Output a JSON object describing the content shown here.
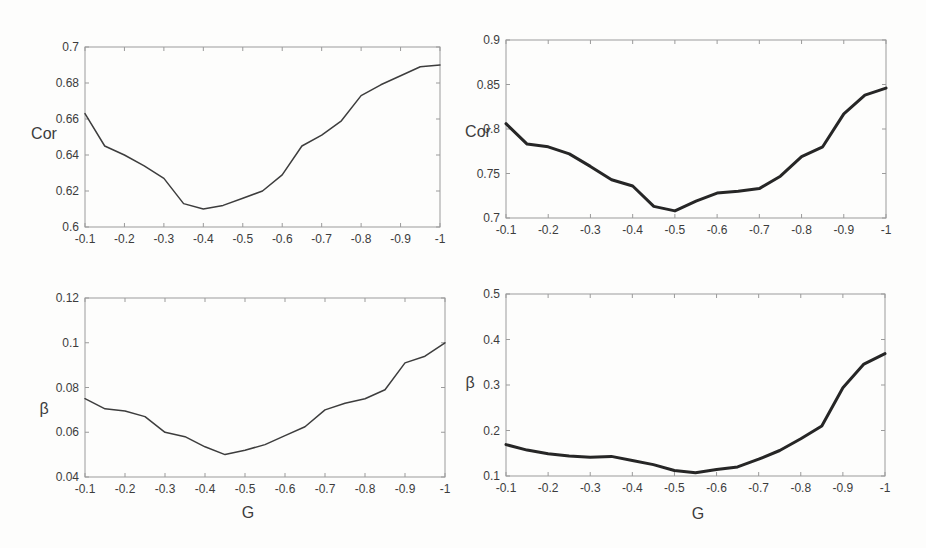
{
  "figure": {
    "background": "#fdfdfc",
    "text_color": "#3c3c3c",
    "axis_color": "#9b9b9b",
    "left_column_line_color": "#3d3d3d",
    "right_column_line_color": "#262626"
  },
  "chart_data": [
    {
      "id": "cor-vs-g-left",
      "type": "line",
      "position": "top-left",
      "title": "",
      "ylabel": "Cor",
      "xlabel": "",
      "legend": "none",
      "grid": false,
      "xlim": [
        -0.1,
        -1
      ],
      "ylim": [
        0.6,
        0.7
      ],
      "xticks": [
        -0.1,
        -0.2,
        -0.3,
        -0.4,
        -0.5,
        -0.6,
        -0.7,
        -0.8,
        -0.9,
        -1
      ],
      "xtick_labels": [
        "-0.1",
        "-0.2",
        "-0.3",
        "-0.4",
        "-0.5",
        "-0.6",
        "-0.7",
        "-0.8",
        "-0.9",
        "-1"
      ],
      "yticks": [
        0.6,
        0.62,
        0.64,
        0.66,
        0.68,
        0.7
      ],
      "ytick_labels": [
        "0.6",
        "0.62",
        "0.64",
        "0.66",
        "0.68",
        "0.7"
      ],
      "x": [
        -0.1,
        -0.15,
        -0.2,
        -0.25,
        -0.3,
        -0.35,
        -0.4,
        -0.45,
        -0.5,
        -0.55,
        -0.6,
        -0.65,
        -0.7,
        -0.75,
        -0.8,
        -0.85,
        -0.9,
        -0.95,
        -1.0
      ],
      "values": [
        0.663,
        0.645,
        0.64,
        0.634,
        0.627,
        0.613,
        0.61,
        0.612,
        0.616,
        0.62,
        0.629,
        0.645,
        0.651,
        0.659,
        0.673,
        0.679,
        0.684,
        0.689,
        0.69
      ],
      "line_color": "#3d3d3d",
      "line_width": 1.5
    },
    {
      "id": "cor-vs-g-right",
      "type": "line",
      "position": "top-right",
      "title": "",
      "ylabel": "Cor",
      "xlabel": "",
      "legend": "none",
      "grid": false,
      "xlim": [
        -0.1,
        -1
      ],
      "ylim": [
        0.7,
        0.9
      ],
      "xticks": [
        -0.1,
        -0.2,
        -0.3,
        -0.4,
        -0.5,
        -0.6,
        -0.7,
        -0.8,
        -0.9,
        -1
      ],
      "xtick_labels": [
        "-0.1",
        "-0.2",
        "-0.3",
        "-0.4",
        "-0.5",
        "-0.6",
        "-0.7",
        "-0.8",
        "-0.9",
        "-1"
      ],
      "yticks": [
        0.7,
        0.75,
        0.8,
        0.85,
        0.9
      ],
      "ytick_labels": [
        "0.7",
        "0.75",
        "0.8",
        "0.85",
        "0.9"
      ],
      "x": [
        -0.1,
        -0.15,
        -0.2,
        -0.25,
        -0.3,
        -0.35,
        -0.4,
        -0.45,
        -0.5,
        -0.55,
        -0.6,
        -0.65,
        -0.7,
        -0.75,
        -0.8,
        -0.85,
        -0.9,
        -0.95,
        -1.0
      ],
      "values": [
        0.806,
        0.783,
        0.78,
        0.772,
        0.758,
        0.743,
        0.736,
        0.713,
        0.708,
        0.719,
        0.728,
        0.73,
        0.733,
        0.747,
        0.769,
        0.78,
        0.817,
        0.838,
        0.846
      ],
      "line_color": "#262626",
      "line_width": 3
    },
    {
      "id": "beta-vs-g-left",
      "type": "line",
      "position": "bottom-left",
      "title": "",
      "ylabel": "β",
      "xlabel": "G",
      "legend": "none",
      "grid": false,
      "xlim": [
        -0.1,
        -1
      ],
      "ylim": [
        0.04,
        0.12
      ],
      "xticks": [
        -0.1,
        -0.2,
        -0.3,
        -0.4,
        -0.5,
        -0.6,
        -0.7,
        -0.8,
        -0.9,
        -1
      ],
      "xtick_labels": [
        "-0.1",
        "-0.2",
        "-0.3",
        "-0.4",
        "-0.5",
        "-0.6",
        "-0.7",
        "-0.8",
        "-0.9",
        "-1"
      ],
      "yticks": [
        0.04,
        0.06,
        0.08,
        0.1,
        0.12
      ],
      "ytick_labels": [
        "0.04",
        "0.06",
        "0.08",
        "0.1",
        "0.12"
      ],
      "x": [
        -0.1,
        -0.15,
        -0.2,
        -0.25,
        -0.3,
        -0.35,
        -0.4,
        -0.45,
        -0.5,
        -0.55,
        -0.6,
        -0.65,
        -0.7,
        -0.75,
        -0.8,
        -0.85,
        -0.9,
        -0.95,
        -1.0
      ],
      "values": [
        0.075,
        0.0705,
        0.0695,
        0.067,
        0.06,
        0.058,
        0.0535,
        0.05,
        0.052,
        0.0545,
        0.0585,
        0.0625,
        0.07,
        0.073,
        0.075,
        0.079,
        0.091,
        0.094,
        0.1
      ],
      "line_color": "#3d3d3d",
      "line_width": 1.5
    },
    {
      "id": "beta-vs-g-right",
      "type": "line",
      "position": "bottom-right",
      "title": "",
      "ylabel": "β",
      "xlabel": "G",
      "legend": "none",
      "grid": false,
      "xlim": [
        -0.1,
        -1
      ],
      "ylim": [
        0.1,
        0.5
      ],
      "xticks": [
        -0.1,
        -0.2,
        -0.3,
        -0.4,
        -0.5,
        -0.6,
        -0.7,
        -0.8,
        -0.9,
        -1
      ],
      "xtick_labels": [
        "-0.1",
        "-0.2",
        "-0.3",
        "-0.4",
        "-0.5",
        "-0.6",
        "-0.7",
        "-0.8",
        "-0.9",
        "-1"
      ],
      "yticks": [
        0.1,
        0.2,
        0.3,
        0.4,
        0.5
      ],
      "ytick_labels": [
        "0.1",
        "0.2",
        "0.3",
        "0.4",
        "0.5"
      ],
      "x": [
        -0.1,
        -0.15,
        -0.2,
        -0.25,
        -0.3,
        -0.35,
        -0.4,
        -0.45,
        -0.5,
        -0.55,
        -0.6,
        -0.65,
        -0.7,
        -0.75,
        -0.8,
        -0.85,
        -0.9,
        -0.95,
        -1.0
      ],
      "values": [
        0.169,
        0.157,
        0.149,
        0.144,
        0.141,
        0.143,
        0.134,
        0.125,
        0.112,
        0.107,
        0.114,
        0.12,
        0.137,
        0.156,
        0.182,
        0.21,
        0.294,
        0.346,
        0.369
      ],
      "line_color": "#262626",
      "line_width": 3
    }
  ]
}
